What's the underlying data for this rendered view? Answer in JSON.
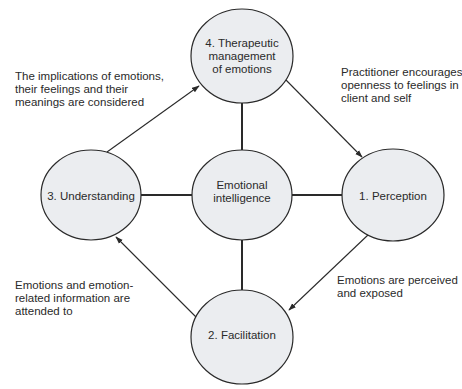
{
  "diagram": {
    "type": "cycle",
    "colors": {
      "node_fill": "#ebedf0",
      "stroke": "#2a2a2a",
      "text": "#2a2a2a",
      "background": "#ffffff"
    },
    "center": {
      "lines": [
        "Emotional",
        "intelligence"
      ]
    },
    "nodes": [
      {
        "id": "perception",
        "lines": [
          "1. Perception"
        ]
      },
      {
        "id": "facilitation",
        "lines": [
          "2. Facilitation"
        ]
      },
      {
        "id": "understanding",
        "lines": [
          "3. Understanding"
        ]
      },
      {
        "id": "therapeutic",
        "lines": [
          "4. Therapeutic",
          "management",
          "of emotions"
        ]
      }
    ],
    "annotations": [
      {
        "id": "understanding-to-therapeutic",
        "lines": [
          "The implications of emotions,",
          "their feelings and their",
          "meanings are considered"
        ]
      },
      {
        "id": "therapeutic-to-perception",
        "lines": [
          "Practitioner encourages",
          "openness to feelings in",
          "client and self"
        ]
      },
      {
        "id": "facilitation-to-understanding",
        "lines": [
          "Emotions and emotion-",
          "related information are",
          "attended to"
        ]
      },
      {
        "id": "perception-to-facilitation",
        "lines": [
          "Emotions are perceived",
          "and exposed"
        ]
      }
    ],
    "edges": [
      {
        "from": "3. Understanding",
        "to": "4. Therapeutic management of emotions",
        "type": "arrow"
      },
      {
        "from": "4. Therapeutic management of emotions",
        "to": "1. Perception",
        "type": "arrow"
      },
      {
        "from": "1. Perception",
        "to": "2. Facilitation",
        "type": "arrow"
      },
      {
        "from": "2. Facilitation",
        "to": "3. Understanding",
        "type": "arrow"
      },
      {
        "from": "Emotional intelligence",
        "to": "1. Perception",
        "type": "line"
      },
      {
        "from": "Emotional intelligence",
        "to": "2. Facilitation",
        "type": "line"
      },
      {
        "from": "Emotional intelligence",
        "to": "3. Understanding",
        "type": "line"
      },
      {
        "from": "Emotional intelligence",
        "to": "4. Therapeutic management of emotions",
        "type": "line"
      }
    ]
  }
}
